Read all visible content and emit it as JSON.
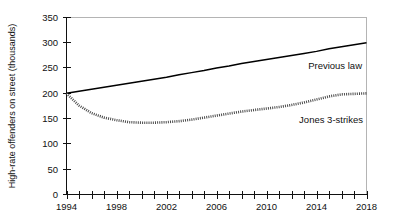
{
  "chart_data": {
    "type": "line",
    "title": "",
    "xlabel": "",
    "ylabel": "High-rate offenders on street (thousands)",
    "xlim": [
      1994,
      2018
    ],
    "ylim": [
      0,
      350
    ],
    "ytick_values": [
      0,
      50,
      100,
      150,
      200,
      250,
      300,
      350
    ],
    "ytick_labels": [
      "0",
      "50",
      "100",
      "150",
      "200",
      "250",
      "300",
      "350"
    ],
    "xtick_values": [
      1994,
      1995,
      1996,
      1997,
      1998,
      1999,
      2000,
      2001,
      2002,
      2003,
      2004,
      2005,
      2006,
      2007,
      2008,
      2009,
      2010,
      2011,
      2012,
      2013,
      2014,
      2015,
      2016,
      2017,
      2018
    ],
    "xtick_labels_shown": [
      "1994",
      "1998",
      "2002",
      "2006",
      "2010",
      "2014",
      "2018"
    ],
    "xtick_label_values": [
      1994,
      1998,
      2002,
      2006,
      2010,
      2014,
      2018
    ],
    "grid": false,
    "legend_position": "inline-annotation",
    "x": [
      1994,
      1995,
      1996,
      1997,
      1998,
      1999,
      2000,
      2001,
      2002,
      2003,
      2004,
      2005,
      2006,
      2007,
      2008,
      2009,
      2010,
      2011,
      2012,
      2013,
      2014,
      2015,
      2016,
      2017,
      2018
    ],
    "series": [
      {
        "name": "Previous law",
        "style": "solid",
        "color": "#000000",
        "label_text": "Previous law",
        "values": [
          200,
          204,
          208,
          212,
          216,
          220,
          224,
          228,
          232,
          237,
          241,
          245,
          250,
          254,
          259,
          263,
          267,
          271,
          275,
          279,
          283,
          288,
          292,
          296,
          300
        ]
      },
      {
        "name": "Jones 3-strikes",
        "style": "dotted",
        "color": "#4a4a4a",
        "label_text": "Jones 3-strikes",
        "values": [
          200,
          176,
          161,
          152,
          147,
          143,
          142,
          142,
          143,
          145,
          148,
          152,
          156,
          160,
          164,
          167,
          170,
          173,
          177,
          182,
          188,
          194,
          198,
          199,
          200
        ]
      }
    ]
  },
  "annotations": {
    "previous_law_label": "Previous law",
    "jones_label": "Jones 3-strikes"
  },
  "colors": {
    "axis": "#111111",
    "frame": "#b4b4b4",
    "series_previous_law": "#000000",
    "series_jones": "#4a4a4a",
    "background": "#ffffff"
  }
}
